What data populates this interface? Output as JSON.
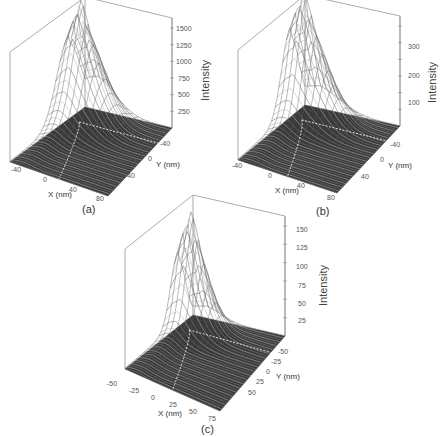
{
  "figure": {
    "panels": [
      {
        "id": "a",
        "caption": "(a)"
      },
      {
        "id": "b",
        "caption": "(b)"
      },
      {
        "id": "c",
        "caption": "(c)"
      }
    ]
  },
  "chart_data": [
    {
      "type": "surface3d",
      "panel": "(a)",
      "title": "",
      "xlabel": "X (nm)",
      "ylabel": "Y (nm)",
      "zlabel": "Intensity",
      "x_ticks": [
        "-40",
        "0",
        "40",
        "80"
      ],
      "y_ticks": [
        "-40",
        "0",
        "40"
      ],
      "z_ticks": [
        "250",
        "500",
        "750",
        "1000",
        "1250",
        "1500"
      ],
      "xlim": [
        -60,
        90
      ],
      "ylim": [
        -60,
        90
      ],
      "zlim": [
        0,
        1500
      ],
      "peak": {
        "x": -20,
        "y": -40,
        "intensity": 1300
      },
      "description": "Very sharp narrow peak near the back corner, decaying quickly along a ridge toward X=80; dashed white projection lines on base plane"
    },
    {
      "type": "surface3d",
      "panel": "(b)",
      "title": "",
      "xlabel": "X (nm)",
      "ylabel": "Y (nm)",
      "zlabel": "Intensity",
      "x_ticks": [
        "-40",
        "0",
        "40",
        "80"
      ],
      "y_ticks": [
        "-40",
        "0",
        "40"
      ],
      "z_ticks": [
        "100",
        "200",
        "300"
      ],
      "xlim": [
        -60,
        90
      ],
      "ylim": [
        -60,
        90
      ],
      "zlim": [
        0,
        350
      ],
      "peak": {
        "x": -20,
        "y": -40,
        "intensity": 320
      },
      "description": "Broader peak near the back corner with a long decaying ridge; dashed white projection lines on base plane"
    },
    {
      "type": "surface3d",
      "panel": "(c)",
      "title": "",
      "xlabel": "X (nm)",
      "ylabel": "Y (nm)",
      "zlabel": "Intensity",
      "x_ticks": [
        "-50",
        "-25",
        "0",
        "25",
        "50",
        "75"
      ],
      "y_ticks": [
        "-50",
        "-25",
        "0",
        "25",
        "50"
      ],
      "z_ticks": [
        "25",
        "50",
        "75",
        "100",
        "125",
        "150"
      ],
      "xlim": [
        -60,
        85
      ],
      "ylim": [
        -60,
        70
      ],
      "zlim": [
        0,
        150
      ],
      "peak": {
        "x": -10,
        "y": -30,
        "intensity": 115
      },
      "description": "Smooth broad Gaussian-like peak, tail extending along ridge; dashed white projection lines on base plane"
    }
  ]
}
